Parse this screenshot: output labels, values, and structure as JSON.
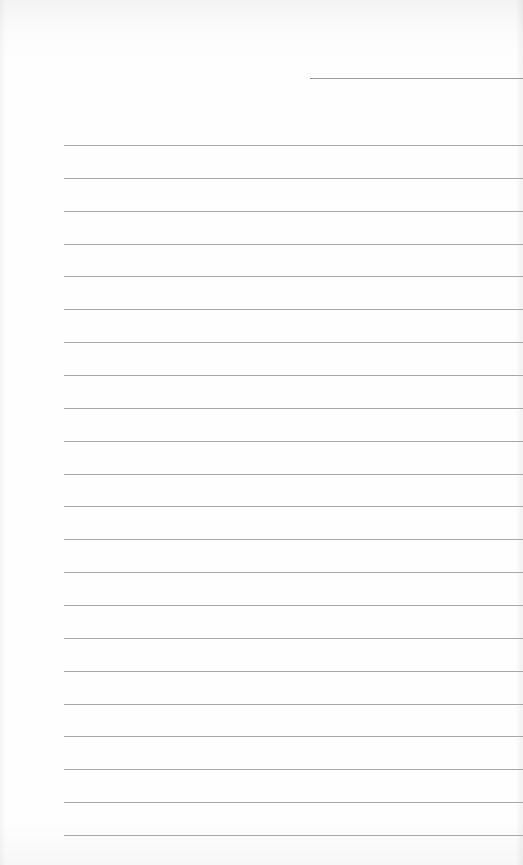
{
  "page": {
    "type": "lined-paper",
    "header_line": {
      "x": 310,
      "y": 78,
      "width": 213
    },
    "rules": {
      "count": 22,
      "start_x": 64,
      "first_y": 145,
      "spacing": 32.86
    },
    "colors": {
      "paper": "#fdfdfd",
      "rule": "#a8a8a8",
      "header_line": "#9a9a9a"
    }
  }
}
